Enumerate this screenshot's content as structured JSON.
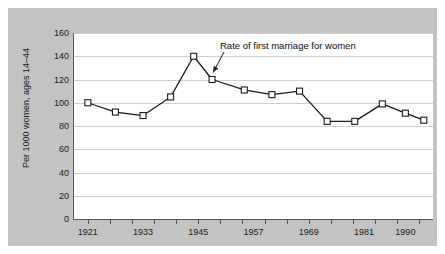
{
  "figure": {
    "background_color": "#c3c3c3",
    "plot_background_color": "#ffffff",
    "grid_color": "#cfcfcf",
    "axis_color": "#5a5a5a",
    "series_color": "#1b1b1b"
  },
  "chart_data": {
    "type": "line",
    "title": "",
    "subtitle": "",
    "xlabel": "",
    "ylabel": "Per 1000 women, ages 14–44",
    "ylim": [
      0,
      160
    ],
    "ytick_labels": [
      "160",
      "140",
      "120",
      "100",
      "80",
      "60",
      "40",
      "20",
      "0"
    ],
    "ytick_values": [
      160,
      140,
      120,
      100,
      80,
      60,
      40,
      20,
      0
    ],
    "xtick_labels": [
      "1921",
      "1933",
      "1945",
      "1957",
      "1969",
      "1981",
      "1990"
    ],
    "xtick_values": [
      1921,
      1933,
      1945,
      1957,
      1969,
      1981,
      1990
    ],
    "xlim": [
      1918,
      1996
    ],
    "grid": "horizontal",
    "legend": "none",
    "marker": "open-square",
    "series": [
      {
        "name": "Rate of first marriage for women",
        "x": [
          1921,
          1927,
          1933,
          1939,
          1944,
          1948,
          1955,
          1961,
          1967,
          1973,
          1979,
          1985,
          1990,
          1994
        ],
        "values": [
          100,
          92,
          89,
          105,
          140,
          120,
          111,
          107,
          110,
          84,
          84,
          99,
          91,
          85
        ]
      }
    ],
    "annotations": [
      {
        "text": "Rate of first marriage for women",
        "points_to_x": 1948,
        "points_to_y": 120
      }
    ]
  }
}
